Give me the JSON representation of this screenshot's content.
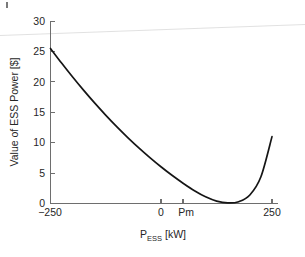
{
  "chart_data": {
    "type": "line",
    "title": "",
    "subtitle": "",
    "xlabel": "P_ESS [kW]",
    "xlabel_main": "P",
    "xlabel_sub": "ESS",
    "xlabel_unit": " [kW]",
    "ylabel": "Value of ESS Power [$]",
    "xlim": [
      -250,
      250
    ],
    "ylim": [
      0,
      30
    ],
    "xticks": [
      -250,
      0,
      50,
      250
    ],
    "xticklabels": [
      "−250",
      "0",
      "Pm",
      "250"
    ],
    "yticks": [
      0,
      5,
      10,
      15,
      20,
      25,
      30
    ],
    "yticklabels": [
      "0",
      "5",
      "10",
      "15",
      "20",
      "25",
      "30"
    ],
    "grid": false,
    "legend": "none",
    "annotations": [
      {
        "text": "Pm",
        "x": 50,
        "y": 0,
        "note": "minimum-power operating point on x-axis"
      }
    ],
    "series": [
      {
        "name": "Value of ESS Power",
        "color": "#151515",
        "x": [
          -250,
          -225,
          -200,
          -175,
          -150,
          -125,
          -100,
          -75,
          -50,
          -25,
          0,
          25,
          50,
          75,
          100,
          125,
          150,
          175,
          200,
          225,
          250
        ],
        "y": [
          25.5,
          23.1,
          20.8,
          18.6,
          16.5,
          14.5,
          12.6,
          10.8,
          9.1,
          7.5,
          6.0,
          4.6,
          3.3,
          2.1,
          1.1,
          0.4,
          0.1,
          0.3,
          1.4,
          4.4,
          11.0
        ]
      }
    ],
    "curve_note": "quadratic-like convex cost curve, minimum approximately zero at Pm"
  },
  "axis": {
    "y_title": "Value of ESS Power [$]",
    "x_tick_left": "−250",
    "x_tick_zero": "0",
    "x_tick_pm": "Pm",
    "x_tick_right": "250",
    "y_tick_0": "0",
    "y_tick_5": "5",
    "y_tick_10": "10",
    "y_tick_15": "15",
    "y_tick_20": "20",
    "y_tick_25": "25",
    "y_tick_30": "30"
  },
  "colors": {
    "curve": "#151515",
    "axis": "#6e6e6e",
    "text": "#262626",
    "background": "#ffffff",
    "scan_line": "#dedede"
  }
}
